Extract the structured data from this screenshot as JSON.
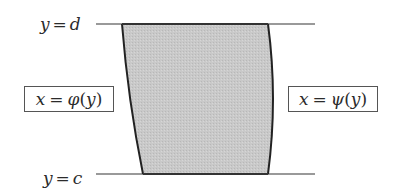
{
  "diagram": {
    "top_line": {
      "var": "y",
      "op": "=",
      "value": "d"
    },
    "bottom_line": {
      "var": "y",
      "op": "=",
      "value": "c"
    },
    "left_curve": {
      "var": "x",
      "op": "=",
      "func": "φ",
      "arg": "y"
    },
    "right_curve": {
      "var": "x",
      "op": "=",
      "func": "ψ",
      "arg": "y"
    },
    "colors": {
      "region_fill": "#c8c8c8",
      "boundary": "#222222",
      "lines": "#666666",
      "box_border": "#555555"
    }
  }
}
